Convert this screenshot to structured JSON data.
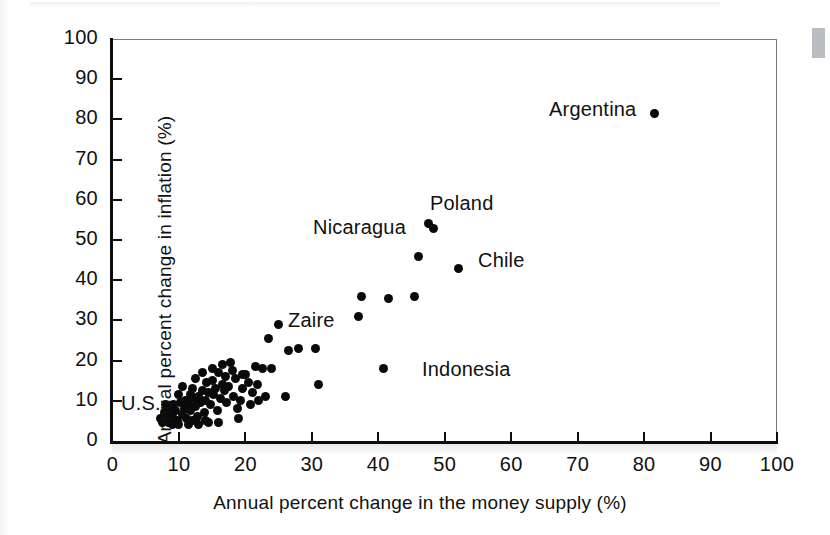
{
  "chart_data": {
    "type": "scatter",
    "title": "",
    "xlabel": "Annual percent change in the money supply (%)",
    "ylabel": "Annual percent change in inflation (%)",
    "xlim": [
      0,
      100
    ],
    "ylim": [
      0,
      100
    ],
    "xticks": [
      0,
      10,
      20,
      30,
      40,
      50,
      60,
      70,
      80,
      90,
      100
    ],
    "yticks": [
      0,
      10,
      20,
      30,
      40,
      50,
      60,
      70,
      80,
      90,
      100
    ],
    "grid": false,
    "legend": "none",
    "marker_color": "#0a0a0a",
    "points": [
      {
        "x": 81.5,
        "y": 81.5,
        "label": "Argentina"
      },
      {
        "x": 52.0,
        "y": 43.0,
        "label": "Chile"
      },
      {
        "x": 47.5,
        "y": 54.0,
        "label": "Poland"
      },
      {
        "x": 48.3,
        "y": 52.8,
        "label": ""
      },
      {
        "x": 46.0,
        "y": 46.0,
        "label": ""
      },
      {
        "x": 45.5,
        "y": 36.0,
        "label": ""
      },
      {
        "x": 41.5,
        "y": 35.5,
        "label": ""
      },
      {
        "x": 40.8,
        "y": 18.0,
        "label": "Indonesia"
      },
      {
        "x": 37.5,
        "y": 36.0,
        "label": ""
      },
      {
        "x": 37.0,
        "y": 31.0,
        "label": "Zaire"
      },
      {
        "x": 31.0,
        "y": 14.0,
        "label": ""
      },
      {
        "x": 30.5,
        "y": 23.0,
        "label": ""
      },
      {
        "x": 28.0,
        "y": 23.0,
        "label": ""
      },
      {
        "x": 26.0,
        "y": 11.0,
        "label": ""
      },
      {
        "x": 25.0,
        "y": 29.0,
        "label": ""
      },
      {
        "x": 23.5,
        "y": 25.5,
        "label": ""
      },
      {
        "x": 22.5,
        "y": 18.0,
        "label": ""
      },
      {
        "x": 21.5,
        "y": 18.5,
        "label": ""
      },
      {
        "x": 21.0,
        "y": 12.0,
        "label": ""
      },
      {
        "x": 20.5,
        "y": 14.5,
        "label": ""
      },
      {
        "x": 20.0,
        "y": 16.5,
        "label": ""
      },
      {
        "x": 19.5,
        "y": 13.0,
        "label": ""
      },
      {
        "x": 19.0,
        "y": 5.5,
        "label": ""
      },
      {
        "x": 18.5,
        "y": 15.5,
        "label": ""
      },
      {
        "x": 18.2,
        "y": 11.0,
        "label": ""
      },
      {
        "x": 18.0,
        "y": 17.5,
        "label": ""
      },
      {
        "x": 17.5,
        "y": 13.5,
        "label": ""
      },
      {
        "x": 17.2,
        "y": 9.5,
        "label": ""
      },
      {
        "x": 17.0,
        "y": 16.0,
        "label": ""
      },
      {
        "x": 16.8,
        "y": 12.5,
        "label": ""
      },
      {
        "x": 16.5,
        "y": 14.0,
        "label": ""
      },
      {
        "x": 16.2,
        "y": 10.5,
        "label": ""
      },
      {
        "x": 16.0,
        "y": 17.0,
        "label": ""
      },
      {
        "x": 15.8,
        "y": 7.5,
        "label": ""
      },
      {
        "x": 15.5,
        "y": 13.0,
        "label": ""
      },
      {
        "x": 15.2,
        "y": 11.5,
        "label": ""
      },
      {
        "x": 15.0,
        "y": 15.0,
        "label": ""
      },
      {
        "x": 14.8,
        "y": 9.0,
        "label": ""
      },
      {
        "x": 14.5,
        "y": 12.0,
        "label": ""
      },
      {
        "x": 14.2,
        "y": 14.5,
        "label": ""
      },
      {
        "x": 14.0,
        "y": 10.0,
        "label": ""
      },
      {
        "x": 13.8,
        "y": 7.0,
        "label": ""
      },
      {
        "x": 13.5,
        "y": 12.5,
        "label": ""
      },
      {
        "x": 13.2,
        "y": 9.5,
        "label": ""
      },
      {
        "x": 13.0,
        "y": 11.0,
        "label": ""
      },
      {
        "x": 12.8,
        "y": 6.0,
        "label": ""
      },
      {
        "x": 12.5,
        "y": 8.5,
        "label": ""
      },
      {
        "x": 12.2,
        "y": 10.5,
        "label": ""
      },
      {
        "x": 12.0,
        "y": 13.0,
        "label": ""
      },
      {
        "x": 11.8,
        "y": 7.5,
        "label": ""
      },
      {
        "x": 11.5,
        "y": 9.0,
        "label": ""
      },
      {
        "x": 11.2,
        "y": 5.5,
        "label": ""
      },
      {
        "x": 11.0,
        "y": 10.0,
        "label": ""
      },
      {
        "x": 10.8,
        "y": 8.0,
        "label": ""
      },
      {
        "x": 10.5,
        "y": 6.5,
        "label": ""
      },
      {
        "x": 10.2,
        "y": 9.5,
        "label": ""
      },
      {
        "x": 10.0,
        "y": 11.5,
        "label": ""
      },
      {
        "x": 9.8,
        "y": 5.0,
        "label": ""
      },
      {
        "x": 9.5,
        "y": 7.5,
        "label": ""
      },
      {
        "x": 9.2,
        "y": 9.0,
        "label": ""
      },
      {
        "x": 9.0,
        "y": 6.0,
        "label": ""
      },
      {
        "x": 8.8,
        "y": 8.0,
        "label": ""
      },
      {
        "x": 8.5,
        "y": 4.5,
        "label": ""
      },
      {
        "x": 8.2,
        "y": 6.5,
        "label": ""
      },
      {
        "x": 8.0,
        "y": 5.5,
        "label": ""
      },
      {
        "x": 7.8,
        "y": 7.0,
        "label": ""
      },
      {
        "x": 7.5,
        "y": 4.5,
        "label": ""
      },
      {
        "x": 7.2,
        "y": 5.5,
        "label": ""
      },
      {
        "x": 16.0,
        "y": 4.5,
        "label": ""
      },
      {
        "x": 14.5,
        "y": 4.5,
        "label": ""
      },
      {
        "x": 13.0,
        "y": 4.0,
        "label": ""
      },
      {
        "x": 11.5,
        "y": 4.0,
        "label": ""
      },
      {
        "x": 10.0,
        "y": 4.0,
        "label": ""
      },
      {
        "x": 19.5,
        "y": 16.5,
        "label": ""
      },
      {
        "x": 20.8,
        "y": 9.0,
        "label": ""
      },
      {
        "x": 23.0,
        "y": 11.0,
        "label": ""
      },
      {
        "x": 17.8,
        "y": 19.5,
        "label": ""
      },
      {
        "x": 16.5,
        "y": 19.0,
        "label": ""
      },
      {
        "x": 12.5,
        "y": 15.5,
        "label": ""
      },
      {
        "x": 13.5,
        "y": 17.0,
        "label": ""
      },
      {
        "x": 15.0,
        "y": 18.0,
        "label": ""
      },
      {
        "x": 18.8,
        "y": 8.0,
        "label": ""
      },
      {
        "x": 19.2,
        "y": 10.0,
        "label": ""
      },
      {
        "x": 14.0,
        "y": 5.0,
        "label": ""
      },
      {
        "x": 12.0,
        "y": 5.0,
        "label": ""
      },
      {
        "x": 9.0,
        "y": 4.0,
        "label": ""
      },
      {
        "x": 8.0,
        "y": 9.0,
        "label": ""
      },
      {
        "x": 10.5,
        "y": 13.5,
        "label": ""
      },
      {
        "x": 11.8,
        "y": 11.5,
        "label": ""
      },
      {
        "x": 21.8,
        "y": 14.0,
        "label": ""
      },
      {
        "x": 22.0,
        "y": 10.0,
        "label": ""
      },
      {
        "x": 24.0,
        "y": 18.0,
        "label": ""
      },
      {
        "x": 26.5,
        "y": 22.5,
        "label": ""
      }
    ],
    "annotations": [
      {
        "text": "Argentina",
        "px": 549,
        "py": 98
      },
      {
        "text": "Poland",
        "px": 430,
        "py": 192
      },
      {
        "text": "Nicaragua",
        "px": 313,
        "py": 216
      },
      {
        "text": "Chile",
        "px": 478,
        "py": 249
      },
      {
        "text": "Zaire",
        "px": 288,
        "py": 309
      },
      {
        "text": "Indonesia",
        "px": 422,
        "py": 358
      },
      {
        "text": "U.S.",
        "px": 121,
        "py": 392
      }
    ]
  },
  "axes": {
    "y_title": "Annual percent change in inflation (%)",
    "x_title": "Annual percent change in the money supply (%)",
    "x_tick_labels": [
      "0",
      "10",
      "20",
      "30",
      "40",
      "50",
      "60",
      "70",
      "80",
      "90",
      "100"
    ],
    "y_tick_labels": [
      "0",
      "10",
      "20",
      "30",
      "40",
      "50",
      "60",
      "70",
      "80",
      "90",
      "100"
    ]
  }
}
